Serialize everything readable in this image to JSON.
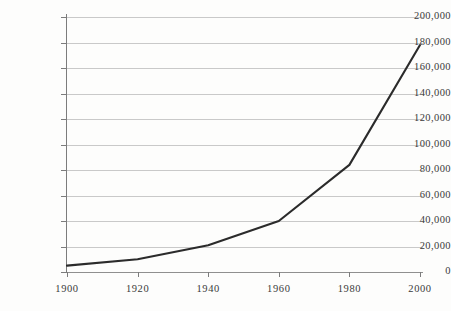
{
  "chart_data": {
    "type": "line",
    "title": "",
    "subtitle": "",
    "xlabel": "",
    "ylabel": "",
    "x": [
      1900,
      1920,
      1940,
      1960,
      1980,
      2000
    ],
    "values": [
      5000,
      10000,
      21000,
      40000,
      84000,
      178000
    ],
    "series": [
      {
        "name": "",
        "values": [
          5000,
          10000,
          21000,
          40000,
          84000,
          178000
        ]
      }
    ],
    "xlim": [
      1900,
      2000
    ],
    "ylim": [
      0,
      200000
    ],
    "x_tick_labels": [
      "1900",
      "1920",
      "1940",
      "1960",
      "1980",
      "2000"
    ],
    "x_ticks": [
      1900,
      1920,
      1940,
      1960,
      1980,
      2000
    ],
    "y_ticks": [
      0,
      20000,
      40000,
      60000,
      80000,
      100000,
      120000,
      140000,
      160000,
      180000,
      200000
    ],
    "y_tick_labels": [
      "0",
      "20,000",
      "40,000",
      "60,000",
      "80,000",
      "100,000",
      "120,000",
      "140,000",
      "160,000",
      "180,000",
      "200,000"
    ],
    "grid": true,
    "grid_axis": "y",
    "legend": false,
    "legend_position": "none",
    "annotations": [],
    "colors": {
      "background": "#fdfdfc",
      "line": "#2b2b2b",
      "grid": "#c9c9c9",
      "axis": "#7c7c7c",
      "text": "#3a3a3a"
    }
  }
}
